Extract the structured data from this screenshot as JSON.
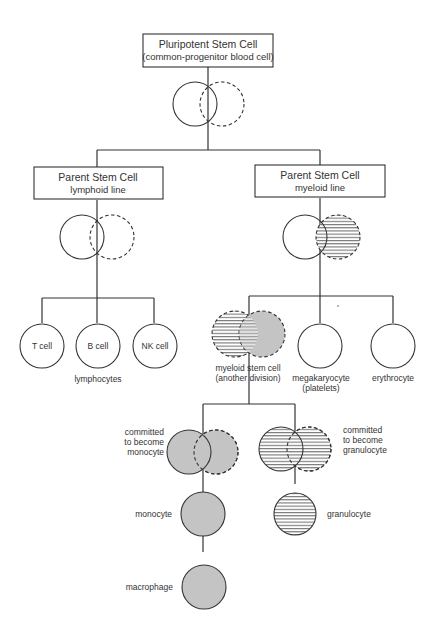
{
  "diagram": {
    "colors": {
      "line": "#333333",
      "gray_fill": "#c4c4c4",
      "hatch_line": "#555555",
      "background": "#ffffff"
    },
    "boxes": {
      "root": {
        "title": "Pluripotent Stem Cell",
        "subtitle": "(common-progenitor blood cell)"
      },
      "lymphoid": {
        "title": "Parent Stem Cell",
        "subtitle": "lymphoid line"
      },
      "myeloid": {
        "title": "Parent Stem Cell",
        "subtitle": "myeloid line"
      }
    },
    "lymphocytes": {
      "cells": [
        {
          "label": "T cell"
        },
        {
          "label": "B cell"
        },
        {
          "label": "NK cell"
        }
      ],
      "group_label": "lymphocytes"
    },
    "myeloid_children": {
      "myeloid_stem": {
        "line1": "myeloid stem cell",
        "line2": "(another division)"
      },
      "megakaryocyte": {
        "line1": "megakaryocyte",
        "line2": "(platelets)"
      },
      "erythrocyte": {
        "line1": "erythrocyte"
      }
    },
    "committed": {
      "monocyte": {
        "line1": "committed",
        "line2": "to become",
        "line3": "monocyte"
      },
      "granulocyte": {
        "line1": "committed",
        "line2": "to become",
        "line3": "granulocyte"
      }
    },
    "terminal": {
      "monocyte": "monocyte",
      "macrophage": "macrophage",
      "granulocyte": "granulocyte"
    }
  }
}
